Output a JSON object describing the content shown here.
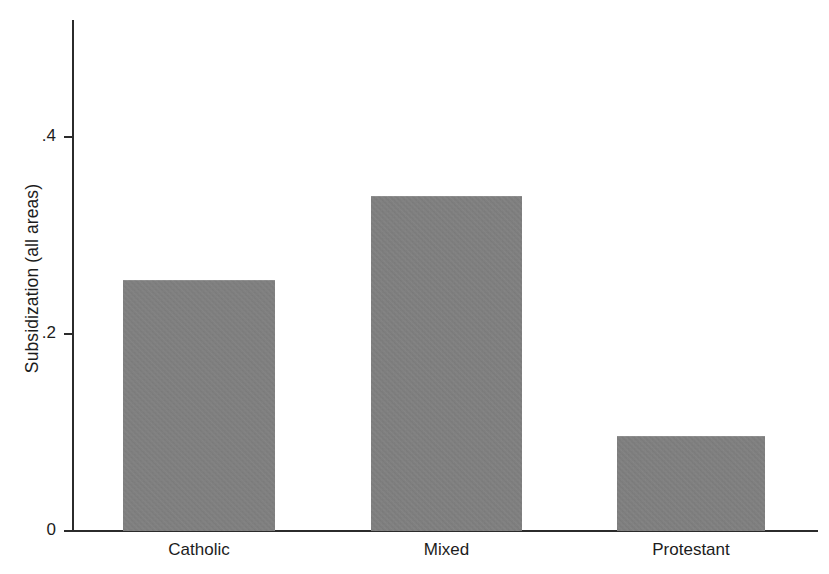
{
  "chart_data": {
    "type": "bar",
    "title": "",
    "subtitle": "",
    "xlabel": "",
    "ylabel": "Subsidization (all areas)",
    "categories": [
      "Catholic",
      "Mixed",
      "Protestant"
    ],
    "values": [
      0.255,
      0.34,
      0.096
    ],
    "series": [
      {
        "name": "Subsidization (all areas)",
        "values": [
          0.255,
          0.34,
          0.096
        ]
      }
    ],
    "ylim": [
      0,
      0.52
    ],
    "xlim": [
      0,
      3
    ],
    "y_ticks": [
      0,
      0.2,
      0.4
    ],
    "y_tick_labels": [
      "0",
      ".2",
      ".4"
    ],
    "grid": false,
    "legend": false,
    "legend_position": "none",
    "bar_color": "#808080",
    "axis_color": "#2b2b2b",
    "background_color": "#ffffff",
    "annotations": []
  },
  "axis": {
    "y_title": "Subsidization (all areas)",
    "ticks": [
      {
        "label": ".4",
        "value": 0.4
      },
      {
        "label": ".2",
        "value": 0.2
      },
      {
        "label": "0",
        "value": 0
      }
    ]
  },
  "bars": [
    {
      "label": "Catholic",
      "value": 0.255
    },
    {
      "label": "Mixed",
      "value": 0.34
    },
    {
      "label": "Protestant",
      "value": 0.096
    }
  ]
}
